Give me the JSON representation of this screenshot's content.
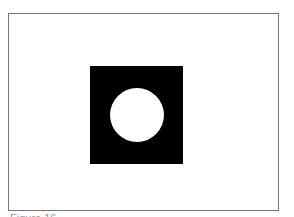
{
  "figure": {
    "shapes": [
      {
        "type": "square",
        "fill": "#000000"
      },
      {
        "type": "circle",
        "fill": "#ffffff"
      }
    ],
    "frame_color": "#777777",
    "caption": "Figure 16 ..."
  }
}
